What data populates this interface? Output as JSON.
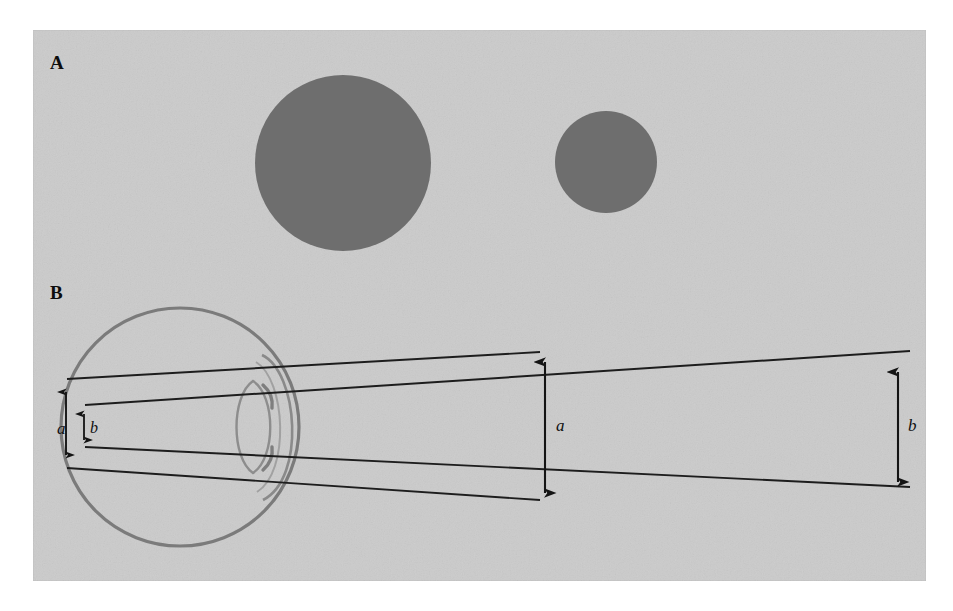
{
  "figure": {
    "background_color": "#ffffff",
    "plate_color": "#cccccc",
    "plate": {
      "x": 33,
      "y": 30,
      "width": 893,
      "height": 551
    },
    "ink_color": "#1a1a1a",
    "eye_outline_color": "#6f6f6f",
    "disc_color": "#6e6e6e"
  },
  "panels": [
    {
      "id": "A",
      "label": "A",
      "description": "Two filled grey discs of different size on a grey background",
      "discs": [
        {
          "name": "large-disc",
          "cx": 343,
          "cy": 163,
          "r": 88,
          "color": "#6e6e6e"
        },
        {
          "name": "small-disc",
          "cx": 606,
          "cy": 162,
          "r": 51,
          "color": "#6e6e6e"
        }
      ]
    },
    {
      "id": "B",
      "label": "B",
      "description": "Schematic eye in cross-section with two pairs of rays passing through the nodal point, forming retinal images a and b of two distant objects",
      "eyeball": {
        "name": "eyeball",
        "cx": 180,
        "cy": 427,
        "r": 119
      },
      "cornea": {
        "name": "cornea"
      },
      "lens": {
        "name": "crystalline-lens",
        "cx": 255,
        "cy": 427,
        "rx": 22,
        "ry": 46
      },
      "nodal_point": {
        "x": 253,
        "y": 427
      },
      "labels": [
        {
          "name": "retinal-image-a",
          "text": "a",
          "x": 57,
          "y": 420
        },
        {
          "name": "retinal-image-b",
          "text": "b",
          "x": 90,
          "y": 420
        },
        {
          "name": "object-a",
          "text": "a",
          "x": 556,
          "y": 417
        },
        {
          "name": "object-b",
          "text": "b",
          "x": 908,
          "y": 417
        }
      ],
      "arrows": [
        {
          "name": "arrow-a-retinal",
          "x": 66,
          "y1": 389,
          "y2": 457,
          "double_headed": true
        },
        {
          "name": "arrow-b-retinal",
          "x": 84,
          "y1": 412,
          "y2": 442,
          "double_headed": true
        },
        {
          "name": "arrow-a-object",
          "x": 545,
          "y1": 358,
          "y2": 497,
          "double_headed": true
        },
        {
          "name": "arrow-b-object",
          "x": 898,
          "y1": 368,
          "y2": 486,
          "double_headed": true
        }
      ],
      "rays": [
        {
          "name": "ray-a-upper",
          "from": [
            67,
            379
          ],
          "to": [
            540,
            352
          ]
        },
        {
          "name": "ray-a-lower",
          "from": [
            67,
            468
          ],
          "to": [
            540,
            500
          ]
        },
        {
          "name": "ray-b-upper",
          "from": [
            85,
            405
          ],
          "to": [
            910,
            351
          ]
        },
        {
          "name": "ray-b-lower",
          "from": [
            85,
            447
          ],
          "to": [
            910,
            487
          ]
        }
      ]
    }
  ]
}
